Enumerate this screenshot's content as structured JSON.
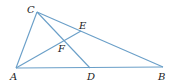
{
  "diagram": {
    "title": "",
    "line_color": "#6a9fc8",
    "label_color": "#222222",
    "points": {
      "A": {
        "label": "A"
      },
      "B": {
        "label": "B"
      },
      "C": {
        "label": "C"
      },
      "D": {
        "label": "D"
      },
      "E": {
        "label": "E"
      },
      "F": {
        "label": "F"
      }
    },
    "segments": [
      {
        "from": "A",
        "to": "B"
      },
      {
        "from": "A",
        "to": "C"
      },
      {
        "from": "C",
        "to": "B"
      },
      {
        "from": "C",
        "to": "D"
      },
      {
        "from": "A",
        "to": "E"
      }
    ]
  }
}
